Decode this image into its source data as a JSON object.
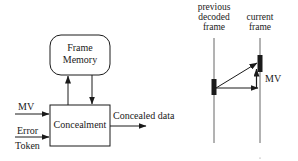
{
  "block_diagram": {
    "frame_memory": {
      "line1": "Frame",
      "line2": "Memory"
    },
    "concealment": {
      "label": "Concealment"
    },
    "inputs": {
      "mv": "MV",
      "error_line1": "Error",
      "error_line2": "Token"
    },
    "output": {
      "label": "Concealed data"
    }
  },
  "motion_diagram": {
    "previous_frame": {
      "line1": "previous",
      "line2": "decoded",
      "line3": "frame"
    },
    "current_frame": {
      "line1": "current",
      "line2": "frame"
    },
    "mv_label": "MV"
  },
  "colors": {
    "stroke": "#1a1a1a",
    "block_fill": "#1a1a1a",
    "frame_line": "#666666"
  }
}
